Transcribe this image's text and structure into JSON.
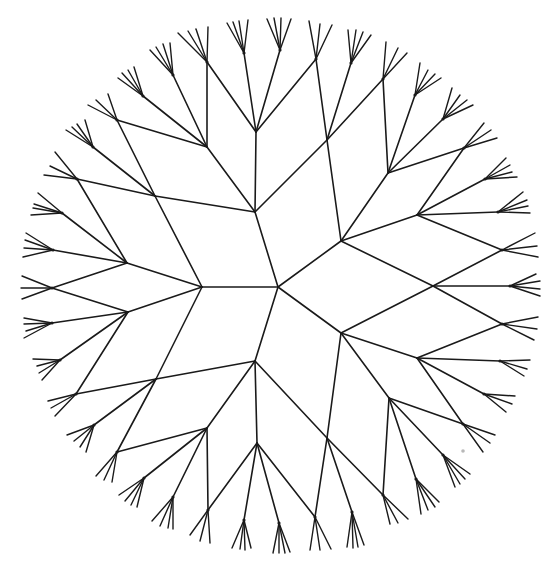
{
  "figure": {
    "width": 554,
    "height": 565,
    "stroke_color": "#1a1a1a",
    "background": "#ffffff",
    "speck": {
      "x": 463,
      "y": 451,
      "r": 1.8,
      "color": "#b8b8b8"
    },
    "center": {
      "x": 278,
      "y": 287
    }
  },
  "edges": [
    [
      278,
      287,
      255,
      212
    ],
    [
      278,
      287,
      341,
      241
    ],
    [
      278,
      287,
      202,
      287
    ],
    [
      278,
      287,
      341,
      333
    ],
    [
      278,
      287,
      255,
      361
    ],
    [
      255,
      212,
      155,
      196
    ],
    [
      255,
      212,
      207,
      147
    ],
    [
      255,
      212,
      256,
      132
    ],
    [
      255,
      212,
      327,
      140
    ],
    [
      341,
      241,
      327,
      140
    ],
    [
      341,
      241,
      388,
      173
    ],
    [
      341,
      241,
      417,
      215
    ],
    [
      341,
      241,
      433,
      286
    ],
    [
      341,
      333,
      433,
      286
    ],
    [
      341,
      333,
      417,
      358
    ],
    [
      341,
      333,
      389,
      398
    ],
    [
      341,
      333,
      327,
      438
    ],
    [
      255,
      361,
      156,
      379
    ],
    [
      255,
      361,
      207,
      428
    ],
    [
      255,
      361,
      257,
      443
    ],
    [
      255,
      361,
      327,
      438
    ],
    [
      202,
      287,
      155,
      196
    ],
    [
      202,
      287,
      127,
      263
    ],
    [
      202,
      287,
      128,
      312
    ],
    [
      202,
      287,
      156,
      379
    ],
    [
      155,
      196,
      117,
      120
    ],
    [
      155,
      196,
      93,
      147
    ],
    [
      155,
      196,
      77,
      179
    ],
    [
      207,
      147,
      117,
      120
    ],
    [
      207,
      147,
      143,
      96
    ],
    [
      207,
      147,
      173,
      75
    ],
    [
      207,
      147,
      207,
      62
    ],
    [
      256,
      132,
      207,
      62
    ],
    [
      256,
      132,
      244,
      53
    ],
    [
      256,
      132,
      280,
      50
    ],
    [
      256,
      132,
      316,
      59
    ],
    [
      327,
      140,
      316,
      59
    ],
    [
      327,
      140,
      351,
      63
    ],
    [
      327,
      140,
      383,
      79
    ],
    [
      388,
      173,
      383,
      79
    ],
    [
      388,
      173,
      415,
      95
    ],
    [
      388,
      173,
      443,
      119
    ],
    [
      388,
      173,
      464,
      148
    ],
    [
      417,
      215,
      464,
      148
    ],
    [
      417,
      215,
      485,
      179
    ],
    [
      417,
      215,
      498,
      212
    ],
    [
      417,
      215,
      502,
      250
    ],
    [
      433,
      286,
      502,
      250
    ],
    [
      433,
      286,
      510,
      286
    ],
    [
      433,
      286,
      502,
      324
    ],
    [
      417,
      358,
      502,
      324
    ],
    [
      417,
      358,
      500,
      361
    ],
    [
      417,
      358,
      484,
      394
    ],
    [
      417,
      358,
      463,
      424
    ],
    [
      389,
      398,
      463,
      424
    ],
    [
      389,
      398,
      443,
      455
    ],
    [
      389,
      398,
      416,
      479
    ],
    [
      389,
      398,
      383,
      495
    ],
    [
      327,
      438,
      383,
      495
    ],
    [
      327,
      438,
      352,
      512
    ],
    [
      327,
      438,
      315,
      517
    ],
    [
      257,
      443,
      315,
      517
    ],
    [
      257,
      443,
      279,
      523
    ],
    [
      257,
      443,
      244,
      520
    ],
    [
      257,
      443,
      208,
      510
    ],
    [
      207,
      428,
      208,
      510
    ],
    [
      207,
      428,
      173,
      497
    ],
    [
      207,
      428,
      144,
      478
    ],
    [
      207,
      428,
      117,
      452
    ],
    [
      156,
      379,
      117,
      452
    ],
    [
      156,
      379,
      94,
      425
    ],
    [
      156,
      379,
      76,
      394
    ],
    [
      128,
      312,
      76,
      394
    ],
    [
      128,
      312,
      60,
      360
    ],
    [
      128,
      312,
      52,
      323
    ],
    [
      128,
      312,
      52,
      288
    ],
    [
      127,
      263,
      52,
      288
    ],
    [
      127,
      263,
      53,
      250
    ],
    [
      127,
      263,
      62,
      213
    ],
    [
      127,
      263,
      77,
      179
    ]
  ],
  "fans": [
    {
      "c": [
        207,
        62
      ],
      "tips": [
        [
          178,
          33
        ],
        [
          188,
          31
        ],
        [
          196,
          29
        ],
        [
          208,
          27
        ]
      ]
    },
    {
      "c": [
        244,
        53
      ],
      "tips": [
        [
          227,
          23
        ],
        [
          233,
          22
        ],
        [
          239,
          21
        ],
        [
          248,
          20
        ]
      ]
    },
    {
      "c": [
        280,
        50
      ],
      "tips": [
        [
          267,
          19
        ],
        [
          274,
          18
        ],
        [
          281,
          18
        ],
        [
          291,
          19
        ]
      ]
    },
    {
      "c": [
        316,
        59
      ],
      "tips": [
        [
          309,
          21
        ],
        [
          320,
          24
        ],
        [
          332,
          25
        ]
      ]
    },
    {
      "c": [
        351,
        63
      ],
      "tips": [
        [
          348,
          30
        ],
        [
          356,
          30
        ],
        [
          363,
          32
        ],
        [
          371,
          35
        ]
      ]
    },
    {
      "c": [
        383,
        79
      ],
      "tips": [
        [
          386,
          42
        ],
        [
          398,
          48
        ],
        [
          407,
          53
        ]
      ]
    },
    {
      "c": [
        415,
        95
      ],
      "tips": [
        [
          420,
          63
        ],
        [
          428,
          70
        ],
        [
          435,
          74
        ],
        [
          441,
          78
        ]
      ]
    },
    {
      "c": [
        443,
        119
      ],
      "tips": [
        [
          452,
          88
        ],
        [
          460,
          95
        ],
        [
          467,
          100
        ],
        [
          473,
          105
        ]
      ]
    },
    {
      "c": [
        464,
        148
      ],
      "tips": [
        [
          484,
          123
        ],
        [
          491,
          130
        ],
        [
          497,
          138
        ]
      ]
    },
    {
      "c": [
        485,
        179
      ],
      "tips": [
        [
          506,
          158
        ],
        [
          510,
          165
        ],
        [
          512,
          172
        ],
        [
          517,
          177
        ]
      ]
    },
    {
      "c": [
        498,
        212
      ],
      "tips": [
        [
          523,
          192
        ],
        [
          527,
          200
        ],
        [
          528,
          206
        ],
        [
          530,
          213
        ]
      ]
    },
    {
      "c": [
        502,
        250
      ],
      "tips": [
        [
          535,
          233
        ],
        [
          537,
          246
        ],
        [
          538,
          257
        ]
      ]
    },
    {
      "c": [
        510,
        286
      ],
      "tips": [
        [
          536,
          274
        ],
        [
          540,
          281
        ],
        [
          540,
          289
        ],
        [
          540,
          296
        ]
      ]
    },
    {
      "c": [
        502,
        324
      ],
      "tips": [
        [
          538,
          317
        ],
        [
          537,
          329
        ],
        [
          534,
          340
        ]
      ]
    },
    {
      "c": [
        500,
        361
      ],
      "tips": [
        [
          530,
          360
        ],
        [
          527,
          369
        ],
        [
          524,
          376
        ]
      ]
    },
    {
      "c": [
        484,
        394
      ],
      "tips": [
        [
          515,
          396
        ],
        [
          512,
          404
        ],
        [
          506,
          412
        ]
      ]
    },
    {
      "c": [
        463,
        424
      ],
      "tips": [
        [
          495,
          435
        ],
        [
          490,
          443
        ],
        [
          483,
          452
        ]
      ]
    },
    {
      "c": [
        443,
        455
      ],
      "tips": [
        [
          470,
          474
        ],
        [
          465,
          479
        ],
        [
          460,
          484
        ],
        [
          455,
          487
        ]
      ]
    },
    {
      "c": [
        416,
        479
      ],
      "tips": [
        [
          439,
          502
        ],
        [
          435,
          507
        ],
        [
          428,
          510
        ],
        [
          421,
          514
        ]
      ]
    },
    {
      "c": [
        383,
        495
      ],
      "tips": [
        [
          408,
          519
        ],
        [
          398,
          523
        ],
        [
          390,
          524
        ]
      ]
    },
    {
      "c": [
        352,
        512
      ],
      "tips": [
        [
          364,
          545
        ],
        [
          358,
          547
        ],
        [
          353,
          548
        ],
        [
          347,
          547
        ]
      ]
    },
    {
      "c": [
        315,
        517
      ],
      "tips": [
        [
          331,
          549
        ],
        [
          320,
          550
        ],
        [
          310,
          550
        ]
      ]
    },
    {
      "c": [
        279,
        523
      ],
      "tips": [
        [
          290,
          552
        ],
        [
          285,
          553
        ],
        [
          279,
          553
        ],
        [
          273,
          553
        ]
      ]
    },
    {
      "c": [
        244,
        520
      ],
      "tips": [
        [
          251,
          548
        ],
        [
          245,
          550
        ],
        [
          240,
          549
        ],
        [
          232,
          548
        ]
      ]
    },
    {
      "c": [
        208,
        510
      ],
      "tips": [
        [
          210,
          543
        ],
        [
          200,
          541
        ],
        [
          190,
          535
        ]
      ]
    },
    {
      "c": [
        173,
        497
      ],
      "tips": [
        [
          173,
          529
        ],
        [
          168,
          528
        ],
        [
          160,
          526
        ],
        [
          152,
          521
        ]
      ]
    },
    {
      "c": [
        144,
        478
      ],
      "tips": [
        [
          137,
          507
        ],
        [
          131,
          505
        ],
        [
          125,
          501
        ],
        [
          119,
          495
        ]
      ]
    },
    {
      "c": [
        117,
        452
      ],
      "tips": [
        [
          96,
          476
        ],
        [
          104,
          480
        ],
        [
          112,
          482
        ]
      ]
    },
    {
      "c": [
        94,
        425
      ],
      "tips": [
        [
          86,
          452
        ],
        [
          80,
          447
        ],
        [
          74,
          441
        ],
        [
          67,
          435
        ]
      ]
    },
    {
      "c": [
        76,
        394
      ],
      "tips": [
        [
          55,
          416
        ],
        [
          51,
          408
        ],
        [
          48,
          401
        ]
      ]
    },
    {
      "c": [
        60,
        360
      ],
      "tips": [
        [
          42,
          380
        ],
        [
          39,
          373
        ],
        [
          37,
          366
        ],
        [
          33,
          359
        ]
      ]
    },
    {
      "c": [
        52,
        323
      ],
      "tips": [
        [
          24,
          318
        ],
        [
          24,
          324
        ],
        [
          26,
          331
        ],
        [
          24,
          338
        ]
      ]
    },
    {
      "c": [
        52,
        288
      ],
      "tips": [
        [
          22,
          276
        ],
        [
          21,
          288
        ],
        [
          22,
          299
        ]
      ]
    },
    {
      "c": [
        53,
        250
      ],
      "tips": [
        [
          26,
          233
        ],
        [
          25,
          240
        ],
        [
          24,
          248
        ],
        [
          23,
          257
        ]
      ]
    },
    {
      "c": [
        62,
        213
      ],
      "tips": [
        [
          38,
          193
        ],
        [
          34,
          204
        ],
        [
          33,
          208
        ],
        [
          31,
          215
        ]
      ]
    },
    {
      "c": [
        77,
        179
      ],
      "tips": [
        [
          55,
          152
        ],
        [
          50,
          166
        ],
        [
          44,
          175
        ]
      ]
    },
    {
      "c": [
        93,
        147
      ],
      "tips": [
        [
          66,
          130
        ],
        [
          72,
          127
        ],
        [
          77,
          124
        ],
        [
          85,
          120
        ]
      ]
    },
    {
      "c": [
        117,
        120
      ],
      "tips": [
        [
          88,
          105
        ],
        [
          96,
          100
        ],
        [
          108,
          94
        ]
      ]
    },
    {
      "c": [
        143,
        96
      ],
      "tips": [
        [
          118,
          78
        ],
        [
          122,
          73
        ],
        [
          128,
          70
        ],
        [
          134,
          67
        ]
      ]
    },
    {
      "c": [
        173,
        75
      ],
      "tips": [
        [
          150,
          50
        ],
        [
          156,
          47
        ],
        [
          163,
          44
        ],
        [
          170,
          43
        ]
      ]
    }
  ]
}
